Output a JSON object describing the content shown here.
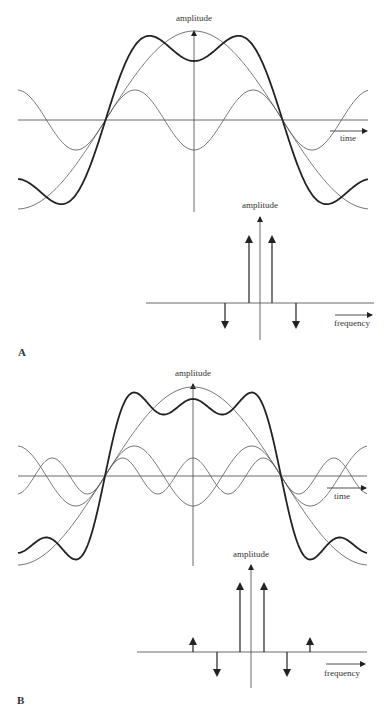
{
  "panels": [
    {
      "label": "A",
      "time_plot": {
        "ylabel": "amplitude",
        "xlabel": "time",
        "components": [
          "fundamental (large, period = 2 × 178px)",
          "3rd harmonic (negative, smaller)"
        ],
        "sum_label": "bold curve = sum of components"
      },
      "spectrum": {
        "ylabel": "amplitude",
        "xlabel": "frequency",
        "spikes": [
          {
            "pos": -3,
            "dir": "down",
            "size": "medium"
          },
          {
            "pos": -1,
            "dir": "up",
            "size": "large"
          },
          {
            "pos": 1,
            "dir": "up",
            "size": "large"
          },
          {
            "pos": 3,
            "dir": "down",
            "size": "medium"
          }
        ]
      }
    },
    {
      "label": "B",
      "time_plot": {
        "ylabel": "amplitude",
        "xlabel": "time",
        "components": [
          "fundamental",
          "3rd harmonic (negative)",
          "5th harmonic (positive)"
        ],
        "sum_label": "bold curve = sum of components"
      },
      "spectrum": {
        "ylabel": "amplitude",
        "xlabel": "frequency",
        "spikes": [
          {
            "pos": -5,
            "dir": "up",
            "size": "small"
          },
          {
            "pos": -3,
            "dir": "down",
            "size": "medium"
          },
          {
            "pos": -1,
            "dir": "up",
            "size": "large"
          },
          {
            "pos": 1,
            "dir": "up",
            "size": "large"
          },
          {
            "pos": 3,
            "dir": "down",
            "size": "medium"
          },
          {
            "pos": 5,
            "dir": "up",
            "size": "small"
          }
        ]
      }
    }
  ]
}
